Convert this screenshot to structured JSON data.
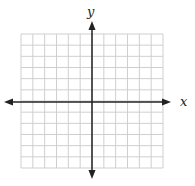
{
  "diagram": {
    "type": "coordinate-grid",
    "x_axis_label": "x",
    "y_axis_label": "y",
    "grid": {
      "columns": 12,
      "rows": 12,
      "line_color": "#cfcfcf"
    },
    "axis_color": "#222222"
  }
}
